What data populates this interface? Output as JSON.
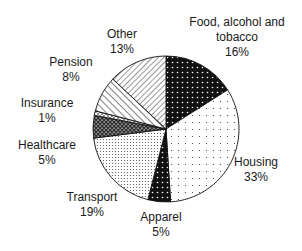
{
  "chart_data": {
    "type": "pie",
    "title": "",
    "start_angle_deg": 0,
    "direction": "clockwise",
    "slices": [
      {
        "label": "Food, alcohol and tobacco",
        "value": 16,
        "pct_label": "16%",
        "pattern": "black-dots"
      },
      {
        "label": "Housing",
        "value": 33,
        "pct_label": "33%",
        "pattern": "sparse-dots"
      },
      {
        "label": "Apparel",
        "value": 5,
        "pct_label": "5%",
        "pattern": "black-dots"
      },
      {
        "label": "Transport",
        "value": 19,
        "pct_label": "19%",
        "pattern": "dense-dots"
      },
      {
        "label": "Healthcare",
        "value": 5,
        "pct_label": "5%",
        "pattern": "crosshatch-dark"
      },
      {
        "label": "Insurance",
        "value": 1,
        "pct_label": "1%",
        "pattern": "crosshatch-light"
      },
      {
        "label": "Pension",
        "value": 8,
        "pct_label": "8%",
        "pattern": "diagonal-back"
      },
      {
        "label": "Other",
        "value": 13,
        "pct_label": "13%",
        "pattern": "diagonal-forward"
      }
    ],
    "legend": "none (direct labels)"
  },
  "labels": {
    "food_line1": "Food, alcohol and",
    "food_line2": "tobacco",
    "food_pct": "16%",
    "housing": "Housing",
    "housing_pct": "33%",
    "apparel": "Apparel",
    "apparel_pct": "5%",
    "transport": "Transport",
    "transport_pct": "19%",
    "healthcare": "Healthcare",
    "healthcare_pct": "5%",
    "insurance": "Insurance",
    "insurance_pct": "1%",
    "pension": "Pension",
    "pension_pct": "8%",
    "other": "Other",
    "other_pct": "13%"
  }
}
